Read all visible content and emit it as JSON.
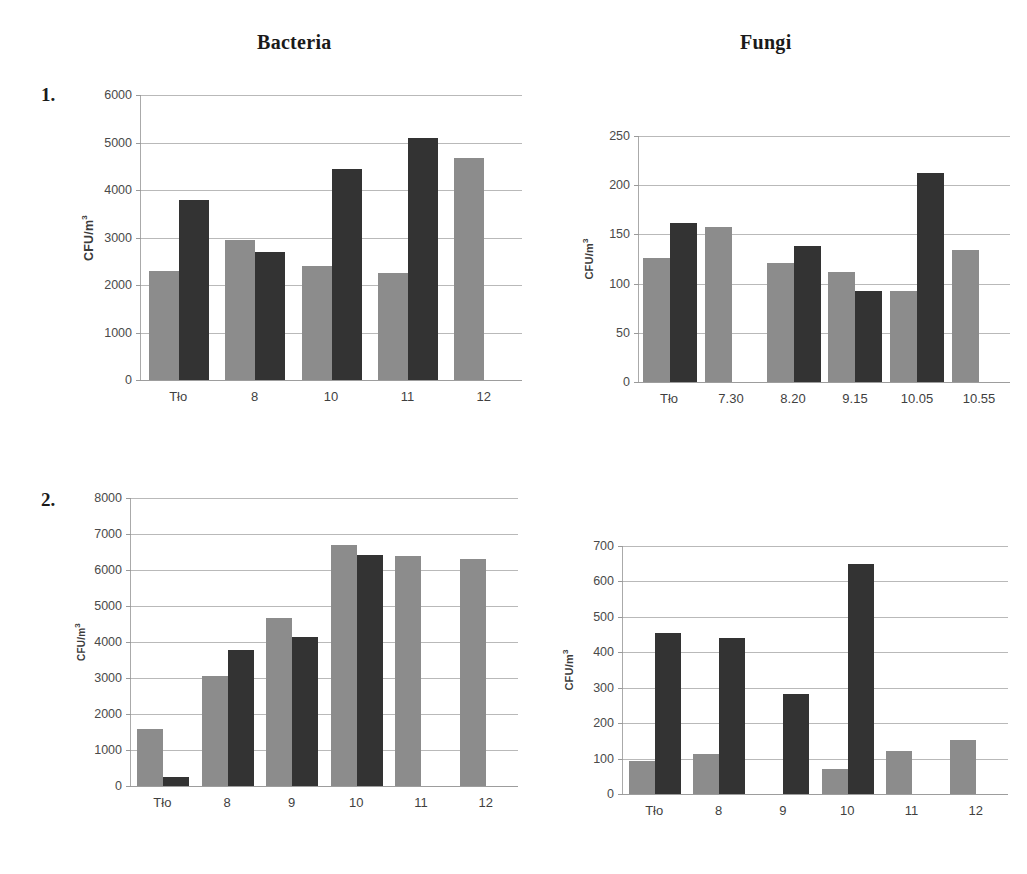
{
  "figure": {
    "column_titles": [
      "Bacteria",
      "Fungi"
    ],
    "row_labels": [
      "1.",
      "2."
    ],
    "series_colors": {
      "series_1": "#8c8c8c",
      "series_2": "#333333"
    },
    "axis_color": "#9a9a9a",
    "grid_color": "#b9b9b9"
  },
  "chart_data": [
    {
      "id": "chart-1",
      "type": "bar",
      "title": "Bacteria",
      "panel": "1.",
      "xlabel": "",
      "ylabel": "CFU/m³",
      "ylim": [
        0,
        6000
      ],
      "yticks": [
        0,
        1000,
        2000,
        3000,
        4000,
        5000,
        6000
      ],
      "ytick_labels": [
        "0",
        "1000",
        "2000",
        "3000",
        "4000",
        "5000",
        "6000"
      ],
      "grid": true,
      "legend": "none",
      "categories": [
        "Tło",
        "8",
        "10",
        "11",
        "12"
      ],
      "series": [
        {
          "name": "series_1",
          "values": [
            2290,
            2940,
            2390,
            2260,
            4680
          ]
        },
        {
          "name": "series_2",
          "values": [
            3800,
            2700,
            4450,
            5100,
            null
          ]
        }
      ]
    },
    {
      "id": "chart-2",
      "type": "bar",
      "title": "Fungi",
      "panel": "1.",
      "xlabel": "",
      "ylabel": "CFU/m³",
      "ylim": [
        0,
        250
      ],
      "yticks": [
        0,
        50,
        100,
        150,
        200,
        250
      ],
      "ytick_labels": [
        "0",
        "50",
        "100",
        "150",
        "200",
        "250"
      ],
      "grid": true,
      "legend": "none",
      "categories": [
        "Tło",
        "7.30",
        "8.20",
        "9.15",
        "10.05",
        "10.55"
      ],
      "series": [
        {
          "name": "series_1",
          "values": [
            126,
            158,
            121,
            112,
            93,
            134
          ]
        },
        {
          "name": "series_2",
          "values": [
            162,
            null,
            138,
            92,
            212,
            null
          ]
        }
      ]
    },
    {
      "id": "chart-3",
      "type": "bar",
      "title": "Bacteria",
      "panel": "2.",
      "xlabel": "",
      "ylabel": "CFU/m³",
      "ylim": [
        0,
        8000
      ],
      "yticks": [
        0,
        1000,
        2000,
        3000,
        4000,
        5000,
        6000,
        7000,
        8000
      ],
      "ytick_labels": [
        "0",
        "1000",
        "2000",
        "3000",
        "4000",
        "5000",
        "6000",
        "7000",
        "8000"
      ],
      "grid": true,
      "legend": "none",
      "categories": [
        "Tło",
        "8",
        "9",
        "10",
        "11",
        "12"
      ],
      "series": [
        {
          "name": "series_1",
          "values": [
            1590,
            3050,
            4680,
            6700,
            6400,
            6300
          ]
        },
        {
          "name": "series_2",
          "values": [
            240,
            3790,
            4150,
            6420,
            null,
            null
          ]
        }
      ]
    },
    {
      "id": "chart-4",
      "type": "bar",
      "title": "Fungi",
      "panel": "2.",
      "xlabel": "",
      "ylabel": "CFU/m³",
      "ylim": [
        0,
        700
      ],
      "yticks": [
        0,
        100,
        200,
        300,
        400,
        500,
        600,
        700
      ],
      "ytick_labels": [
        "0",
        "100",
        "200",
        "300",
        "400",
        "500",
        "600",
        "700"
      ],
      "grid": true,
      "legend": "none",
      "categories": [
        "Tło",
        "8",
        "9",
        "10",
        "11",
        "12"
      ],
      "series": [
        {
          "name": "series_1",
          "values": [
            92,
            113,
            null,
            70,
            121,
            152
          ]
        },
        {
          "name": "series_2",
          "values": [
            455,
            441,
            283,
            650,
            null,
            null
          ]
        }
      ]
    }
  ]
}
